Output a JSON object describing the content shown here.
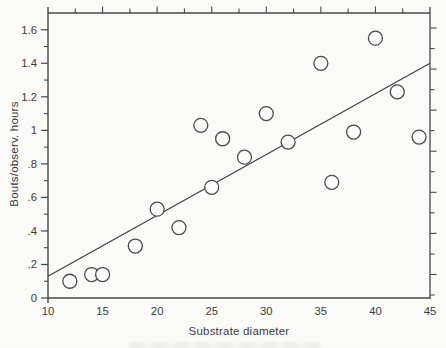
{
  "figure": {
    "background": "#fafaf8",
    "axis_color": "#474747",
    "line_color": "#3f3f3f",
    "marker_color": "#4a4a4a",
    "marker_fill": "#fbfbf9",
    "text_color": "#3c3c3c"
  },
  "chart_data": {
    "type": "scatter",
    "title": "",
    "xlabel": "Substrate diameter",
    "ylabel": "Bouts/observ. hours",
    "xlim": [
      10,
      45
    ],
    "ylim": [
      0,
      1.7
    ],
    "grid": false,
    "legend": null,
    "x_ticks": [
      10,
      15,
      20,
      25,
      30,
      35,
      40,
      45
    ],
    "x_tick_labels": [
      "10",
      "15",
      "20",
      "25",
      "30",
      "35",
      "40",
      "45"
    ],
    "y_ticks": [
      0,
      0.2,
      0.4,
      0.6,
      0.8,
      1.0,
      1.2,
      1.4,
      1.6
    ],
    "y_tick_labels": [
      "0",
      ".2",
      ".4",
      ".6",
      ".8",
      "1",
      "1.2",
      "1.4",
      "1.6"
    ],
    "y_minor_tick_step": 0.1,
    "top_tick_step": 2.5,
    "right_tick_count": 14,
    "points": [
      [
        12,
        0.1
      ],
      [
        14,
        0.14
      ],
      [
        15,
        0.14
      ],
      [
        18,
        0.31
      ],
      [
        20,
        0.53
      ],
      [
        22,
        0.42
      ],
      [
        24,
        1.03
      ],
      [
        25,
        0.66
      ],
      [
        26,
        0.95
      ],
      [
        28,
        0.84
      ],
      [
        30,
        1.1
      ],
      [
        32,
        0.93
      ],
      [
        35,
        1.4
      ],
      [
        36,
        0.69
      ],
      [
        38,
        0.99
      ],
      [
        40,
        1.55
      ],
      [
        42,
        1.23
      ],
      [
        44,
        0.96
      ]
    ],
    "marker": {
      "shape": "circle-open",
      "radius_px": 7
    },
    "trend_line": {
      "x_start": 10,
      "y_start": 0.13,
      "x_end": 45,
      "y_end": 1.4
    }
  }
}
